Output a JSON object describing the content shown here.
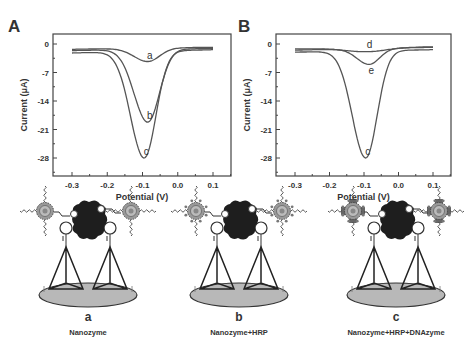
{
  "figure": {
    "panels": [
      {
        "label": "A",
        "ylabel": "Current (μA)",
        "xlabel": "Potential (V)"
      },
      {
        "label": "B",
        "ylabel": "Current (μA)",
        "xlabel": "Potential (V)"
      }
    ],
    "schemes": [
      {
        "letter": "a",
        "caption": "Nanozyme"
      },
      {
        "letter": "b",
        "caption": "Nanozyme+HRP"
      },
      {
        "letter": "c",
        "caption": "Nanozyme+HRP+DNAzyme"
      }
    ],
    "colors": {
      "line": "#555555",
      "axis": "#444444",
      "base": "#b8b8b8",
      "core": "#222222"
    }
  },
  "chart_data": [
    {
      "type": "line",
      "title": "A",
      "xlabel": "Potential (V)",
      "ylabel": "Current (μA)",
      "xlim": [
        -0.35,
        0.15
      ],
      "ylim": [
        -31,
        2
      ],
      "xticks": [
        -0.3,
        -0.2,
        -0.1,
        0.0,
        0.1
      ],
      "xtick_labels": [
        "-0.3",
        "-0.2",
        "-0.1",
        "0.0",
        "0.1"
      ],
      "yticks": [
        0,
        -7,
        -14,
        -21,
        -28
      ],
      "ytick_labels": [
        "0",
        "-7",
        "-14",
        "-21",
        "-28"
      ],
      "grid": false,
      "series": [
        {
          "name": "a",
          "peak_x": -0.085,
          "peak_y": -4.3,
          "start_y": -1.3,
          "end_y": -0.8,
          "width": 0.055
        },
        {
          "name": "b",
          "peak_x": -0.085,
          "peak_y": -19.2,
          "start_y": -1.6,
          "end_y": -1.1,
          "width": 0.055
        },
        {
          "name": "c",
          "peak_x": -0.095,
          "peak_y": -28.0,
          "start_y": -2.2,
          "end_y": -1.4,
          "width": 0.055
        }
      ]
    },
    {
      "type": "line",
      "title": "B",
      "xlabel": "Potential (V)",
      "ylabel": "Current (μA)",
      "xlim": [
        -0.35,
        0.15
      ],
      "ylim": [
        -31,
        2
      ],
      "xticks": [
        -0.3,
        -0.2,
        -0.1,
        0.0,
        0.1
      ],
      "xtick_labels": [
        "-0.3",
        "-0.2",
        "-0.1",
        "0.0",
        "0.1"
      ],
      "yticks": [
        0,
        -7,
        -14,
        -21,
        -28
      ],
      "ytick_labels": [
        "0",
        "-7",
        "-14",
        "-21",
        "-28"
      ],
      "grid": false,
      "series": [
        {
          "name": "d",
          "peak_x": -0.09,
          "peak_y": -1.9,
          "start_y": -1.2,
          "end_y": -0.7,
          "width": 0.09
        },
        {
          "name": "e",
          "peak_x": -0.085,
          "peak_y": -5.0,
          "start_y": -1.5,
          "end_y": -0.8,
          "width": 0.05
        },
        {
          "name": "c",
          "peak_x": -0.095,
          "peak_y": -28.0,
          "start_y": -2.0,
          "end_y": -1.4,
          "width": 0.055
        }
      ]
    }
  ]
}
